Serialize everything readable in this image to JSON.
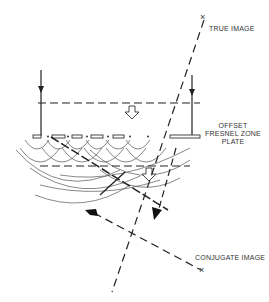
{
  "labels": {
    "true_image": "TRUE IMAGE",
    "offset_plate": [
      "OFFSET",
      "FRESNEL ZONE",
      "PLATE"
    ],
    "conjugate_image": "CONJUGATE IMAGE"
  },
  "markers": {
    "true_image_mark": "×",
    "conjugate_image_mark": "×"
  },
  "icons": {
    "incident-arrow": "down-arrow",
    "wavefront-arrow": "hollow-down-arrow",
    "image-ray-arrow": "solid-arrow"
  },
  "colors": {
    "line": "#222222",
    "wave": "#555555",
    "background": "#ffffff"
  }
}
